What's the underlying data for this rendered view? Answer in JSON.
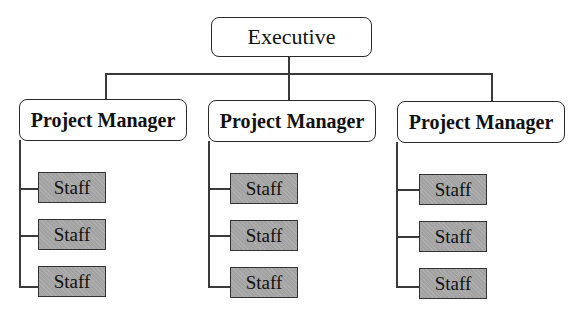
{
  "chart": {
    "root": {
      "label": "Executive"
    },
    "managers": [
      {
        "label": "Project Manager",
        "staff": [
          "Staff",
          "Staff",
          "Staff"
        ]
      },
      {
        "label": "Project Manager",
        "staff": [
          "Staff",
          "Staff",
          "Staff"
        ]
      },
      {
        "label": "Project Manager",
        "staff": [
          "Staff",
          "Staff",
          "Staff"
        ]
      }
    ]
  },
  "colors": {
    "box_border": "#2a2a2a",
    "staff_fill": "#a3a3a3",
    "line": "#3a3a3a"
  }
}
